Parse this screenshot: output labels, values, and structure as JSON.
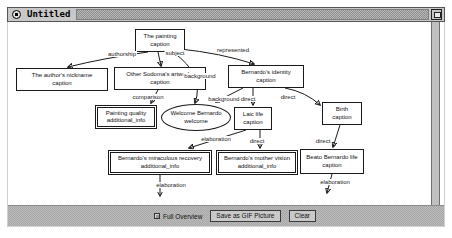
{
  "window": {
    "title": "Untitled"
  },
  "diagram": {
    "nodes": [
      {
        "id": "n1",
        "shape": "rect",
        "lines": [
          "The painting",
          "caption"
        ],
        "x": 127,
        "y": 7,
        "w": 50,
        "h": 23
      },
      {
        "id": "n2",
        "shape": "rect",
        "lines": [
          "The author's nickname",
          "caption"
        ],
        "x": 8,
        "y": 46,
        "w": 92,
        "h": 23
      },
      {
        "id": "n3",
        "shape": "rect",
        "lines": [
          "Other Sodoma's artworks",
          "caption"
        ],
        "x": 106,
        "y": 45,
        "w": 92,
        "h": 23
      },
      {
        "id": "n4",
        "shape": "rect",
        "lines": [
          "Bernardo's identity",
          "caption"
        ],
        "x": 220,
        "y": 43,
        "w": 76,
        "h": 23
      },
      {
        "id": "n5",
        "shape": "double",
        "lines": [
          "Painting quality",
          "additional_info"
        ],
        "x": 87,
        "y": 83,
        "w": 62,
        "h": 24
      },
      {
        "id": "n6",
        "shape": "ellipse",
        "lines": [
          "Welcome Bernardo",
          "welcome"
        ],
        "x": 153,
        "y": 82,
        "w": 70,
        "h": 27
      },
      {
        "id": "n7",
        "shape": "rect",
        "lines": [
          "Laic life",
          "caption"
        ],
        "x": 226,
        "y": 85,
        "w": 38,
        "h": 23
      },
      {
        "id": "n8",
        "shape": "rect",
        "lines": [
          "Birth",
          "caption"
        ],
        "x": 314,
        "y": 80,
        "w": 40,
        "h": 23
      },
      {
        "id": "n9",
        "shape": "double",
        "lines": [
          "Bernardo's miraculous recovery",
          "additional_info"
        ],
        "x": 100,
        "y": 128,
        "w": 104,
        "h": 25
      },
      {
        "id": "n10",
        "shape": "double",
        "lines": [
          "Bernardo's mother vision",
          "additional_info"
        ],
        "x": 208,
        "y": 128,
        "w": 82,
        "h": 25
      },
      {
        "id": "n11",
        "shape": "rect",
        "lines": [
          "Beato Bernardo life",
          "caption"
        ],
        "x": 292,
        "y": 127,
        "w": 64,
        "h": 25
      }
    ],
    "edges": [
      {
        "from": "n1",
        "to": "n2",
        "label": "authorship",
        "path": "M140,30 Q96,36 60,45",
        "lx": 114,
        "ly": 32
      },
      {
        "from": "n1",
        "to": "n3",
        "label": "subject",
        "path": "M150,30 L153,44",
        "lx": 167,
        "ly": 31
      },
      {
        "from": "n1",
        "to": "n4",
        "label": "represented",
        "path": "M172,27 Q212,31 246,42",
        "lx": 225,
        "ly": 28
      },
      {
        "from": "n1",
        "to": "n6",
        "label": "background",
        "path": "M165,30 Q197,53 187,81",
        "lx": 192,
        "ly": 54
      },
      {
        "from": "n4",
        "to": "n6",
        "label": "background",
        "path": "M235,66 Q219,74 208,80",
        "lx": 216,
        "ly": 77
      },
      {
        "from": "n4",
        "to": "n7",
        "label": "direct",
        "path": "M245,66 L245,83",
        "lx": 240,
        "ly": 77
      },
      {
        "from": "n4",
        "to": "n8",
        "label": "direct",
        "path": "M277,66 Q298,70 312,83",
        "lx": 280,
        "ly": 75
      },
      {
        "from": "n3",
        "to": "n5",
        "label": "comparison",
        "path": "M150,68 L143,81",
        "lx": 140,
        "ly": 75
      },
      {
        "from": "n7",
        "to": "n9",
        "label": "elaboration",
        "path": "M238,108 L181,126",
        "lx": 208,
        "ly": 117
      },
      {
        "from": "n7",
        "to": "n10",
        "label": "direct",
        "path": "M252,108 L252,126",
        "lx": 249,
        "ly": 119
      },
      {
        "from": "n8",
        "to": "n11",
        "label": "direct",
        "path": "M332,103 L325,125",
        "lx": 315,
        "ly": 119
      },
      {
        "from": "n9",
        "to": "down",
        "label": "elaboration",
        "path": "M152,153 L152,174",
        "lx": 163,
        "ly": 163
      },
      {
        "from": "n11",
        "to": "down",
        "label": "elaboration",
        "path": "M324,152 L319,171",
        "lx": 327,
        "ly": 160
      }
    ]
  },
  "toolbar": {
    "full_overview": "Full Overview",
    "save_gif": "Save as GIF Picture",
    "clear": "Clear"
  },
  "colors": {
    "titlebar_bg": "#c8c8c8",
    "stipple_dark": "#8e8e8e",
    "stipple_light": "#b8b8b8",
    "toolbar_bg": "#b0b0b0",
    "button_bg": "#c9c9c9",
    "node_border": "#1a1a1a",
    "canvas_bg": "#ffffff"
  }
}
